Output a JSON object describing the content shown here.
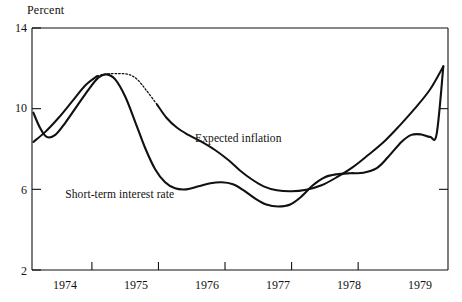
{
  "chart_data": {
    "type": "line",
    "title": "",
    "subtitle": "",
    "xlabel": "",
    "ylabel": "Percent",
    "ylim": [
      2,
      14
    ],
    "xlim": [
      1973.6,
      1979.85
    ],
    "yticks": [
      2,
      6,
      10,
      14
    ],
    "ytick_labels": [
      "2",
      "6",
      "10",
      "14"
    ],
    "xticks": [
      1974.5,
      1975.5,
      1976.5,
      1977.5,
      1978.5
    ],
    "xtick_labels": [
      "1974",
      "1975",
      "1976",
      "1977",
      "1978",
      "1979"
    ],
    "xtick_label_positions": [
      1974.0,
      1975.0,
      1976.0,
      1977.0,
      1978.0,
      1979.0
    ],
    "grid": false,
    "legend_position": "inline-annotations",
    "series": [
      {
        "name": "Expected inflation",
        "label": "Expected inflation",
        "style": "solid-with-dotted-peak",
        "color": "#111111",
        "points": [
          [
            1973.62,
            8.35
          ],
          [
            1973.8,
            8.85
          ],
          [
            1974.0,
            9.55
          ],
          [
            1974.2,
            10.35
          ],
          [
            1974.4,
            11.15
          ],
          [
            1974.58,
            11.62
          ],
          [
            1974.72,
            11.72
          ],
          [
            1974.9,
            11.74
          ],
          [
            1975.05,
            11.7
          ],
          [
            1975.18,
            11.45
          ],
          [
            1975.32,
            10.9
          ],
          [
            1975.48,
            10.2
          ],
          [
            1975.62,
            9.55
          ],
          [
            1975.78,
            9.05
          ],
          [
            1975.95,
            8.7
          ],
          [
            1976.15,
            8.35
          ],
          [
            1976.35,
            7.95
          ],
          [
            1976.55,
            7.45
          ],
          [
            1976.72,
            6.95
          ],
          [
            1976.9,
            6.5
          ],
          [
            1977.08,
            6.15
          ],
          [
            1977.28,
            5.95
          ],
          [
            1977.5,
            5.9
          ],
          [
            1977.72,
            5.98
          ],
          [
            1977.95,
            6.2
          ],
          [
            1978.18,
            6.6
          ],
          [
            1978.42,
            7.1
          ],
          [
            1978.65,
            7.7
          ],
          [
            1978.9,
            8.4
          ],
          [
            1979.12,
            9.15
          ],
          [
            1979.35,
            10.0
          ],
          [
            1979.58,
            10.95
          ],
          [
            1979.78,
            12.1
          ]
        ]
      },
      {
        "name": "Short-term interest rate",
        "label": "Short-term interest rate",
        "style": "solid",
        "color": "#111111",
        "points": [
          [
            1973.62,
            9.8
          ],
          [
            1973.72,
            9.05
          ],
          [
            1973.82,
            8.6
          ],
          [
            1973.95,
            8.7
          ],
          [
            1974.1,
            9.3
          ],
          [
            1974.28,
            10.15
          ],
          [
            1974.45,
            10.95
          ],
          [
            1974.6,
            11.55
          ],
          [
            1974.72,
            11.7
          ],
          [
            1974.85,
            11.45
          ],
          [
            1975.0,
            10.6
          ],
          [
            1975.15,
            9.35
          ],
          [
            1975.3,
            8.05
          ],
          [
            1975.45,
            7.0
          ],
          [
            1975.6,
            6.35
          ],
          [
            1975.75,
            6.05
          ],
          [
            1975.92,
            6.0
          ],
          [
            1976.1,
            6.15
          ],
          [
            1976.28,
            6.3
          ],
          [
            1976.45,
            6.35
          ],
          [
            1976.62,
            6.25
          ],
          [
            1976.78,
            5.95
          ],
          [
            1976.95,
            5.55
          ],
          [
            1977.12,
            5.25
          ],
          [
            1977.3,
            5.15
          ],
          [
            1977.48,
            5.25
          ],
          [
            1977.65,
            5.65
          ],
          [
            1977.82,
            6.2
          ],
          [
            1978.0,
            6.6
          ],
          [
            1978.18,
            6.75
          ],
          [
            1978.38,
            6.8
          ],
          [
            1978.58,
            6.82
          ],
          [
            1978.78,
            7.05
          ],
          [
            1978.95,
            7.6
          ],
          [
            1979.15,
            8.35
          ],
          [
            1979.3,
            8.7
          ],
          [
            1979.45,
            8.72
          ],
          [
            1979.58,
            8.6
          ],
          [
            1979.68,
            8.75
          ],
          [
            1979.78,
            12.1
          ]
        ]
      }
    ],
    "annotations": [
      {
        "text": "Expected inflation",
        "x": 1976.05,
        "y": 8.55
      },
      {
        "text": "Short-term interest rate",
        "x": 1974.1,
        "y": 5.75
      }
    ]
  }
}
